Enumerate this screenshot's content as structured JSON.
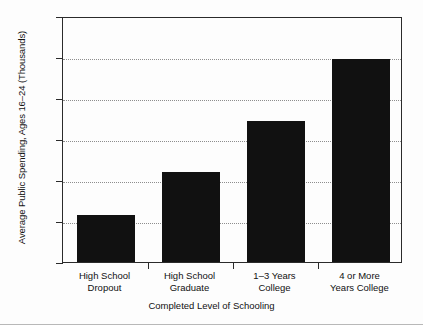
{
  "chart_data": {
    "type": "bar",
    "title": "",
    "xlabel": "Completed Level of Schooling",
    "ylabel": "Average Public Spending, Ages 16–24 (Thousands)",
    "categories": [
      "High School\nDropout",
      "High School\nGraduate",
      "1–3 Years\nCollege",
      "4 or More\nYears College"
    ],
    "category_lines": [
      [
        "High School",
        "Dropout"
      ],
      [
        "High School",
        "Graduate"
      ],
      [
        "1–3 Years",
        "College"
      ],
      [
        "4 or More",
        "Years College"
      ]
    ],
    "values": [
      5.7,
      11.0,
      17.2,
      24.8
    ],
    "ylim": [
      0,
      30
    ],
    "ytick_values": [
      0,
      5,
      10,
      15,
      20,
      25,
      30
    ],
    "ytick_labels": [
      "$0",
      "$5",
      "$10",
      "$15",
      "$20",
      "$25",
      "$30"
    ],
    "grid": "horizontal-dotted",
    "legend": "none",
    "bar_color": "#111111",
    "axis_color": "#2b2b2b",
    "grid_color": "#8d8d8d"
  }
}
